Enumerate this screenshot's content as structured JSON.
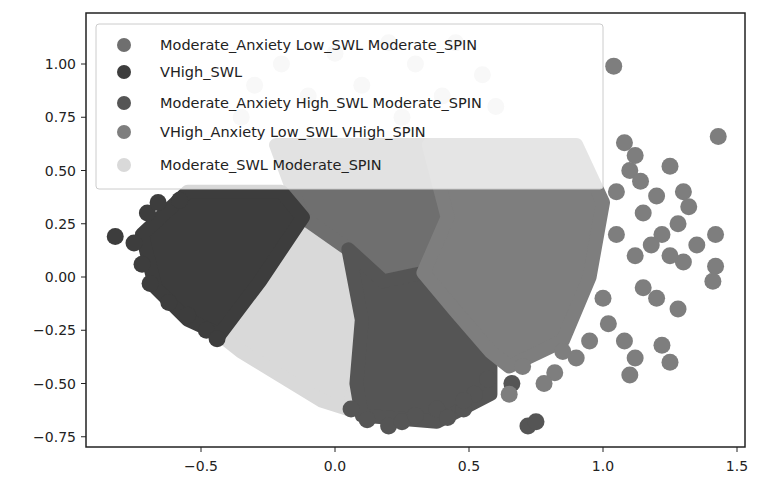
{
  "chart_data": {
    "type": "scatter",
    "title": "",
    "xlabel": "",
    "ylabel": "",
    "xlim": [
      -0.93,
      1.54
    ],
    "ylim": [
      -0.8,
      1.24
    ],
    "xticks": [
      -0.5,
      0.0,
      0.5,
      1.0,
      1.5
    ],
    "xtick_labels": [
      "−0.5",
      "0.0",
      "0.5",
      "1.0",
      "1.5"
    ],
    "yticks": [
      1.0,
      0.75,
      0.5,
      0.25,
      0.0,
      -0.25,
      -0.5,
      -0.75
    ],
    "ytick_labels": [
      "1.00",
      "0.75",
      "0.50",
      "0.25",
      "0.00",
      "−0.25",
      "−0.50",
      "−0.75"
    ],
    "grid": false,
    "legend_position": "upper left",
    "series": [
      {
        "name": "Moderate_Anxiety Low_SWL Moderate_SPIN",
        "color": "#6f6f6f",
        "region": [
          [
            -0.22,
            0.62
          ],
          [
            0.35,
            0.62
          ],
          [
            0.42,
            0.28
          ],
          [
            0.33,
            0.02
          ],
          [
            0.18,
            -0.02
          ],
          [
            0.05,
            0.13
          ],
          [
            -0.12,
            0.28
          ]
        ],
        "points": [
          [
            -0.1,
            0.58
          ],
          [
            0.0,
            0.6
          ],
          [
            0.1,
            0.58
          ],
          [
            0.2,
            0.6
          ],
          [
            0.3,
            0.55
          ]
        ]
      },
      {
        "name": "VHigh_SWL",
        "color": "#3d3d3d",
        "region": [
          [
            -0.55,
            0.4
          ],
          [
            -0.2,
            0.4
          ],
          [
            -0.12,
            0.28
          ],
          [
            -0.28,
            -0.02
          ],
          [
            -0.43,
            -0.27
          ],
          [
            -0.55,
            -0.2
          ],
          [
            -0.67,
            -0.05
          ],
          [
            -0.72,
            0.2
          ]
        ],
        "points": [
          [
            -0.82,
            0.19
          ],
          [
            -0.7,
            0.3
          ],
          [
            -0.66,
            0.35
          ],
          [
            -0.72,
            0.06
          ],
          [
            -0.75,
            0.16
          ],
          [
            -0.69,
            -0.03
          ],
          [
            -0.62,
            -0.12
          ],
          [
            -0.55,
            -0.18
          ],
          [
            -0.48,
            -0.25
          ],
          [
            -0.44,
            -0.29
          ],
          [
            -0.58,
            0.36
          ]
        ]
      },
      {
        "name": "Moderate_Anxiety High_SWL Moderate_SPIN",
        "color": "#555555",
        "region": [
          [
            0.05,
            0.13
          ],
          [
            0.18,
            -0.02
          ],
          [
            0.33,
            0.02
          ],
          [
            0.45,
            -0.16
          ],
          [
            0.58,
            -0.35
          ],
          [
            0.58,
            -0.55
          ],
          [
            0.38,
            -0.68
          ],
          [
            0.1,
            -0.65
          ],
          [
            0.08,
            -0.5
          ],
          [
            0.1,
            -0.2
          ]
        ],
        "points": [
          [
            0.06,
            -0.62
          ],
          [
            0.12,
            -0.67
          ],
          [
            0.2,
            -0.7
          ],
          [
            0.25,
            -0.68
          ],
          [
            0.3,
            -0.65
          ],
          [
            0.38,
            -0.62
          ],
          [
            0.42,
            -0.66
          ],
          [
            0.48,
            -0.62
          ],
          [
            0.52,
            -0.55
          ],
          [
            0.57,
            -0.48
          ],
          [
            0.48,
            -0.58
          ],
          [
            0.72,
            -0.7
          ],
          [
            0.75,
            -0.68
          ],
          [
            0.66,
            -0.5
          ]
        ]
      },
      {
        "name": "VHigh_Anxiety Low_SWL VHigh_SPIN",
        "color": "#7e7e7e",
        "region": [
          [
            0.35,
            0.62
          ],
          [
            0.9,
            0.62
          ],
          [
            1.0,
            0.35
          ],
          [
            0.95,
            0.0
          ],
          [
            0.85,
            -0.3
          ],
          [
            0.65,
            -0.42
          ],
          [
            0.58,
            -0.35
          ],
          [
            0.45,
            -0.16
          ],
          [
            0.33,
            0.02
          ],
          [
            0.42,
            0.28
          ]
        ],
        "points": [
          [
            1.04,
            0.99
          ],
          [
            1.43,
            0.66
          ],
          [
            1.08,
            0.63
          ],
          [
            1.12,
            0.57
          ],
          [
            1.1,
            0.5
          ],
          [
            1.14,
            0.45
          ],
          [
            1.25,
            0.52
          ],
          [
            1.3,
            0.4
          ],
          [
            1.2,
            0.38
          ],
          [
            1.32,
            0.33
          ],
          [
            1.28,
            0.25
          ],
          [
            1.22,
            0.2
          ],
          [
            1.35,
            0.15
          ],
          [
            1.42,
            0.2
          ],
          [
            1.42,
            0.05
          ],
          [
            1.41,
            -0.02
          ],
          [
            1.3,
            0.07
          ],
          [
            1.25,
            0.1
          ],
          [
            1.18,
            0.15
          ],
          [
            1.12,
            0.1
          ],
          [
            1.05,
            0.2
          ],
          [
            1.15,
            -0.05
          ],
          [
            1.2,
            -0.1
          ],
          [
            1.28,
            -0.15
          ],
          [
            1.0,
            -0.1
          ],
          [
            1.08,
            -0.3
          ],
          [
            1.02,
            -0.22
          ],
          [
            1.22,
            -0.32
          ],
          [
            1.25,
            -0.4
          ],
          [
            1.12,
            -0.38
          ],
          [
            1.1,
            -0.46
          ],
          [
            0.95,
            -0.3
          ],
          [
            0.9,
            -0.38
          ],
          [
            0.85,
            -0.35
          ],
          [
            0.82,
            -0.45
          ],
          [
            0.78,
            -0.5
          ],
          [
            0.7,
            -0.42
          ],
          [
            0.65,
            -0.55
          ],
          [
            1.15,
            0.3
          ],
          [
            1.05,
            0.4
          ]
        ]
      },
      {
        "name": "Moderate_SWL Moderate_SPIN",
        "color": "#d9d9d9",
        "region": [
          [
            -0.12,
            0.28
          ],
          [
            0.05,
            0.13
          ],
          [
            0.1,
            -0.2
          ],
          [
            0.08,
            -0.5
          ],
          [
            0.05,
            -0.62
          ],
          [
            -0.05,
            -0.58
          ],
          [
            -0.18,
            -0.48
          ],
          [
            -0.35,
            -0.35
          ],
          [
            -0.43,
            -0.27
          ],
          [
            -0.28,
            -0.02
          ]
        ],
        "points": [
          [
            -0.3,
            0.9
          ],
          [
            -0.2,
            1.0
          ],
          [
            -0.1,
            0.85
          ],
          [
            0.1,
            0.9
          ],
          [
            0.2,
            1.1
          ],
          [
            0.3,
            1.0
          ],
          [
            0.45,
            1.1
          ],
          [
            0.55,
            0.95
          ],
          [
            0.4,
            0.85
          ],
          [
            0.0,
            1.05
          ],
          [
            -0.35,
            0.75
          ],
          [
            0.6,
            0.8
          ],
          [
            0.25,
            0.75
          ]
        ]
      }
    ]
  },
  "axes": {
    "x_tick_labels": [
      "−0.5",
      "0.0",
      "0.5",
      "1.0",
      "1.5"
    ],
    "y_tick_labels": [
      "1.00",
      "0.75",
      "0.50",
      "0.25",
      "0.00",
      "−0.25",
      "−0.50",
      "−0.75"
    ]
  },
  "legend": {
    "items": [
      {
        "label": "Moderate_Anxiety Low_SWL Moderate_SPIN",
        "color": "#6f6f6f"
      },
      {
        "label": "VHigh_SWL",
        "color": "#3d3d3d"
      },
      {
        "label": "Moderate_Anxiety High_SWL Moderate_SPIN",
        "color": "#555555"
      },
      {
        "label": "VHigh_Anxiety Low_SWL VHigh_SPIN",
        "color": "#7e7e7e"
      },
      {
        "label": "Moderate_SWL Moderate_SPIN",
        "color": "#d9d9d9"
      }
    ]
  }
}
